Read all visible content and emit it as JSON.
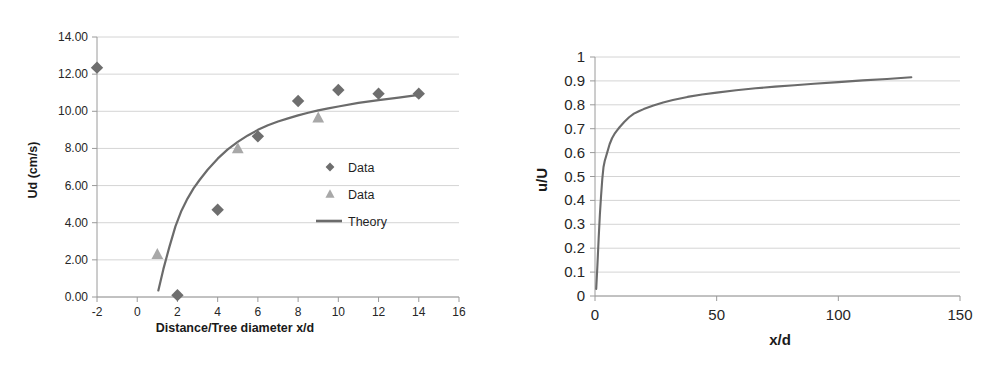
{
  "figure": {
    "background_color": "#ffffff",
    "panel_count": 2
  },
  "chart_data": [
    {
      "type": "scatter",
      "panel": "left",
      "title": "",
      "xlabel": "Distance/Tree diameter x/d",
      "ylabel": "Ud (cm/s)",
      "xlim": [
        -2,
        16
      ],
      "ylim": [
        0,
        14
      ],
      "xticks": [
        -2,
        0,
        2,
        4,
        6,
        8,
        10,
        12,
        14,
        16
      ],
      "xtick_labels": [
        "-2",
        "0",
        "2",
        "4",
        "6",
        "8",
        "10",
        "12",
        "14",
        "16"
      ],
      "yticks": [
        0,
        2,
        4,
        6,
        8,
        10,
        12,
        14
      ],
      "ytick_labels": [
        "0.00",
        "2.00",
        "4.00",
        "6.00",
        "8.00",
        "10.00",
        "12.00",
        "14.00"
      ],
      "grid": "horizontal",
      "legend_position": "inside-right",
      "series": [
        {
          "name": "Data",
          "marker": "diamond",
          "color": "#6e6e6e",
          "x": [
            -2,
            2,
            4,
            6,
            8,
            10,
            12,
            14
          ],
          "y": [
            12.35,
            0.1,
            4.7,
            8.65,
            10.55,
            11.15,
            10.95,
            10.95
          ]
        },
        {
          "name": "Data",
          "marker": "triangle",
          "color": "#a8a8a8",
          "x": [
            1,
            5,
            9
          ],
          "y": [
            2.3,
            8.0,
            9.65
          ]
        },
        {
          "name": "Theory",
          "marker": "line",
          "color": "#6b6b6b",
          "x": [
            1.05,
            1.3,
            1.6,
            1.9,
            2.2,
            2.5,
            2.8,
            3.1,
            3.5,
            4.0,
            4.5,
            5.0,
            5.5,
            6.0,
            6.5,
            7.0,
            7.5,
            8.0,
            8.5,
            9.0,
            9.5,
            10.0,
            11.0,
            12.0,
            13.0,
            14.0
          ],
          "y": [
            0.35,
            1.5,
            2.7,
            3.8,
            4.65,
            5.3,
            5.85,
            6.3,
            6.85,
            7.45,
            7.95,
            8.35,
            8.7,
            9.0,
            9.25,
            9.45,
            9.62,
            9.78,
            9.92,
            10.05,
            10.16,
            10.26,
            10.45,
            10.6,
            10.74,
            10.88
          ]
        }
      ],
      "legend_entries": [
        {
          "label": "Data",
          "marker": "diamond"
        },
        {
          "label": "Data",
          "marker": "triangle"
        },
        {
          "label": "Theory",
          "marker": "line"
        }
      ]
    },
    {
      "type": "line",
      "panel": "right",
      "title": "",
      "xlabel": "x/d",
      "ylabel": "u/U",
      "xlim": [
        0,
        150
      ],
      "ylim": [
        0,
        1
      ],
      "xticks": [
        0,
        50,
        100,
        150
      ],
      "xtick_labels": [
        "0",
        "50",
        "100",
        "150"
      ],
      "yticks": [
        0,
        0.1,
        0.2,
        0.3,
        0.4,
        0.5,
        0.6,
        0.7,
        0.8,
        0.9,
        1
      ],
      "ytick_labels": [
        "0",
        "0.1",
        "0.2",
        "0.3",
        "0.4",
        "0.5",
        "0.6",
        "0.7",
        "0.8",
        "0.9",
        "1"
      ],
      "grid": "horizontal",
      "legend_position": "none",
      "series": [
        {
          "name": "u/U",
          "marker": "line",
          "color": "#6b6b6b",
          "x": [
            0.5,
            1,
            1.5,
            2,
            2.5,
            3,
            3.5,
            4,
            5,
            6,
            7,
            8,
            9,
            10,
            12,
            14,
            16,
            18,
            20,
            24,
            28,
            32,
            38,
            44,
            50,
            58,
            66,
            74,
            82,
            90,
            100,
            110,
            120,
            130
          ],
          "y": [
            0.03,
            0.13,
            0.24,
            0.34,
            0.42,
            0.49,
            0.54,
            0.565,
            0.6,
            0.635,
            0.66,
            0.678,
            0.692,
            0.705,
            0.728,
            0.748,
            0.763,
            0.773,
            0.782,
            0.797,
            0.81,
            0.82,
            0.833,
            0.843,
            0.851,
            0.861,
            0.869,
            0.876,
            0.882,
            0.888,
            0.895,
            0.902,
            0.908,
            0.915
          ]
        }
      ],
      "legend_entries": []
    }
  ]
}
